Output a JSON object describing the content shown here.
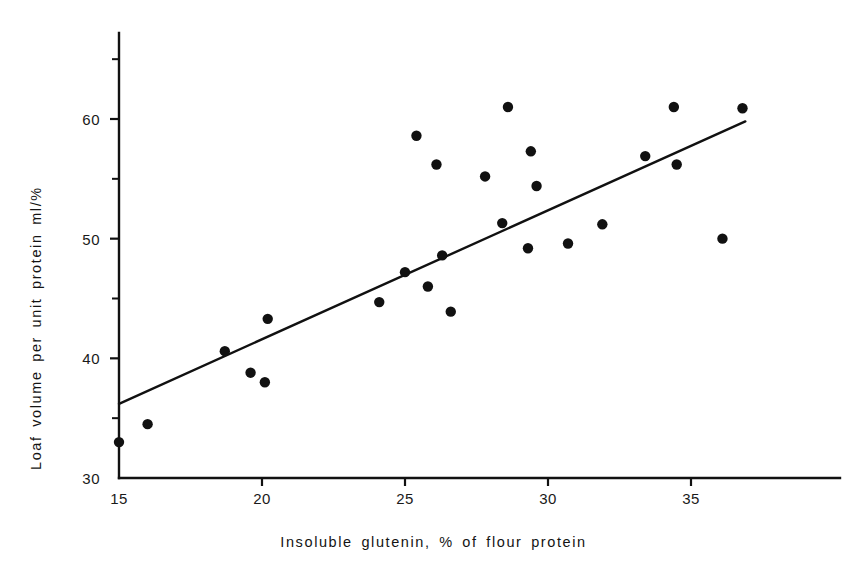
{
  "chart_data": {
    "type": "scatter",
    "title": "",
    "xlabel": "Insoluble glutenin, % of flour protein",
    "ylabel": "Loaf volume per unit protein ml/%",
    "xlim": [
      15,
      37.9
    ],
    "ylim": [
      30,
      67.5
    ],
    "grid": false,
    "legend": null,
    "xticks": [
      15,
      20,
      25,
      30,
      35
    ],
    "xtick_labels": [
      "15",
      "20",
      "25",
      "30",
      "35"
    ],
    "yticks": [
      30,
      40,
      50,
      60
    ],
    "ytick_labels": [
      "30",
      "40",
      "50",
      "60"
    ],
    "y_minor_ticks": [
      35,
      45,
      55,
      65
    ],
    "marker": "filled-circle",
    "marker_color": "#111111",
    "axis_color": "#111111",
    "points": [
      {
        "x": 15.0,
        "y": 33.0
      },
      {
        "x": 16.0,
        "y": 34.5
      },
      {
        "x": 18.7,
        "y": 40.6
      },
      {
        "x": 19.6,
        "y": 38.8
      },
      {
        "x": 20.1,
        "y": 38.0
      },
      {
        "x": 20.2,
        "y": 43.3
      },
      {
        "x": 24.1,
        "y": 44.7
      },
      {
        "x": 25.0,
        "y": 47.2
      },
      {
        "x": 25.4,
        "y": 58.6
      },
      {
        "x": 25.8,
        "y": 46.0
      },
      {
        "x": 26.1,
        "y": 56.2
      },
      {
        "x": 26.3,
        "y": 48.6
      },
      {
        "x": 26.6,
        "y": 43.9
      },
      {
        "x": 27.8,
        "y": 55.2
      },
      {
        "x": 28.4,
        "y": 51.3
      },
      {
        "x": 28.6,
        "y": 61.0
      },
      {
        "x": 29.3,
        "y": 49.2
      },
      {
        "x": 29.4,
        "y": 57.3
      },
      {
        "x": 29.6,
        "y": 54.4
      },
      {
        "x": 30.7,
        "y": 49.6
      },
      {
        "x": 31.9,
        "y": 51.2
      },
      {
        "x": 33.4,
        "y": 56.9
      },
      {
        "x": 34.4,
        "y": 61.0
      },
      {
        "x": 34.5,
        "y": 56.2
      },
      {
        "x": 36.1,
        "y": 50.0
      },
      {
        "x": 36.8,
        "y": 60.9
      }
    ],
    "trend_line": {
      "type": "linear-regression",
      "x_start": 15.0,
      "y_start": 36.2,
      "x_end": 36.9,
      "y_end": 59.8
    }
  },
  "axis_titles": {
    "x": "Insoluble glutenin, % of flour protein",
    "y": "Loaf volume per unit protein ml/%"
  }
}
